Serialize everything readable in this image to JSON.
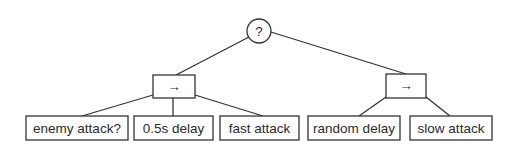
{
  "diagram": {
    "type": "behavior-tree",
    "root": {
      "symbol": "?",
      "kind": "selector"
    },
    "sequences": [
      {
        "symbol": "→",
        "kind": "sequence",
        "children": [
          "enemy attack?",
          "0.5s delay",
          "fast attack"
        ]
      },
      {
        "symbol": "→",
        "kind": "sequence",
        "children": [
          "random delay",
          "slow attack"
        ]
      }
    ],
    "colors": {
      "stroke": "#333333",
      "text": "#2a2a2a",
      "background": "#ffffff"
    }
  }
}
